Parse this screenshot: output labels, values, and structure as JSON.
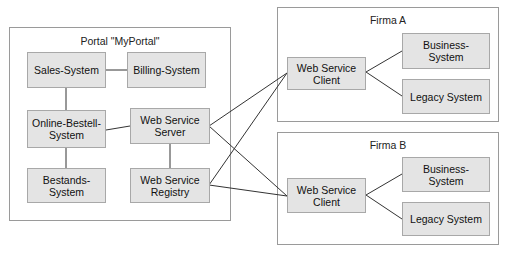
{
  "portal": {
    "title": "Portal \"MyPortal\"",
    "systems": {
      "sales": "Sales-System",
      "billing": "Billing-System",
      "online": "Online-Bestell-\nSystem",
      "ws_server": "Web Service\nServer",
      "bestands": "Bestands-\nSystem",
      "ws_registry": "Web Service\nRegistry"
    }
  },
  "firma_a": {
    "title": "Firma A",
    "client": "Web Service\nClient",
    "business": "Business-\nSystem",
    "legacy": "Legacy System"
  },
  "firma_b": {
    "title": "Firma B",
    "client": "Web Service\nClient",
    "business": "Business-\nSystem",
    "legacy": "Legacy System"
  }
}
